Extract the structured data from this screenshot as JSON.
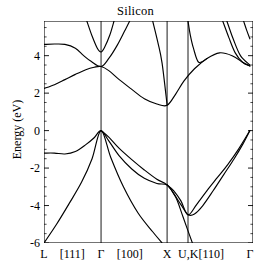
{
  "figure": {
    "title": "Silicon",
    "cropped_header_text": "",
    "background": "#ffffff",
    "line_color": "#000000"
  },
  "chart_data": {
    "type": "line",
    "title": "Silicon",
    "xlabel": "",
    "ylabel": "Energy (eV)",
    "ylim": [
      -6,
      5.85
    ],
    "xlim": [
      0,
      1
    ],
    "grid": false,
    "legend": null,
    "x_tick_labels": [
      "L",
      "[111]",
      "Γ",
      "[100]",
      "X",
      "U,K",
      "[110]",
      "Γ"
    ],
    "x_tick_positions": [
      0.0,
      0.135,
      0.273,
      0.41,
      0.589,
      0.69,
      0.8,
      0.985
    ],
    "y_ticks": [
      -6,
      -4,
      -2,
      0,
      2,
      4
    ],
    "y_tick_labels": [
      "-6",
      "-4",
      "-2",
      "0",
      "2",
      "4"
    ],
    "high_symmetry_lines": [
      {
        "label": "Γ",
        "x": 0.273
      },
      {
        "label": "X",
        "x": 0.589
      },
      {
        "label": "U,K",
        "x": 0.689
      }
    ],
    "annotations": {
      "valence_band_maximum_eV": 0.0,
      "conduction_band_minimum_eV": 1.37,
      "gap_type": "indirect",
      "vbm_point": "Γ",
      "cbm_point": "near X"
    },
    "series": [
      {
        "name": "valence-band-1",
        "points": [
          [
            0.0,
            -6.0
          ],
          [
            0.06,
            -5.0
          ],
          [
            0.12,
            -3.9
          ],
          [
            0.18,
            -2.75
          ],
          [
            0.23,
            -1.5
          ],
          [
            0.273,
            0.0
          ],
          [
            0.32,
            -1.45
          ],
          [
            0.38,
            -3.0
          ],
          [
            0.45,
            -4.4
          ],
          [
            0.52,
            -5.4
          ],
          [
            0.565,
            -6.0
          ]
        ]
      },
      {
        "name": "valence-band-2",
        "points": [
          [
            0.0,
            -1.2
          ],
          [
            0.05,
            -1.2
          ],
          [
            0.1,
            -1.25
          ],
          [
            0.15,
            -1.12
          ],
          [
            0.2,
            -0.75
          ],
          [
            0.24,
            -0.38
          ],
          [
            0.273,
            0.0
          ],
          [
            0.31,
            -0.55
          ],
          [
            0.36,
            -1.35
          ],
          [
            0.42,
            -2.05
          ],
          [
            0.48,
            -2.55
          ],
          [
            0.54,
            -2.82
          ],
          [
            0.589,
            -2.9
          ],
          [
            0.62,
            -3.35
          ],
          [
            0.655,
            -3.95
          ],
          [
            0.689,
            -4.48
          ],
          [
            0.72,
            -4.45
          ],
          [
            0.76,
            -4.0
          ],
          [
            0.81,
            -3.2
          ],
          [
            0.86,
            -2.35
          ],
          [
            0.91,
            -1.5
          ],
          [
            0.95,
            -0.75
          ],
          [
            0.985,
            0.0
          ]
        ]
      },
      {
        "name": "valence-band-3",
        "points": [
          [
            0.273,
            0.0
          ],
          [
            0.31,
            -0.35
          ],
          [
            0.36,
            -0.95
          ],
          [
            0.42,
            -1.55
          ],
          [
            0.48,
            -2.1
          ],
          [
            0.54,
            -2.6
          ],
          [
            0.589,
            -2.9
          ],
          [
            0.63,
            -3.55
          ],
          [
            0.665,
            -4.6
          ],
          [
            0.689,
            -5.35
          ],
          [
            0.71,
            -6.0
          ]
        ]
      },
      {
        "name": "valence-band-4",
        "points": [
          [
            0.589,
            -2.9
          ],
          [
            0.62,
            -3.2
          ],
          [
            0.655,
            -3.75
          ],
          [
            0.689,
            -4.5
          ],
          [
            0.73,
            -3.95
          ],
          [
            0.78,
            -3.2
          ],
          [
            0.83,
            -2.5
          ],
          [
            0.88,
            -1.8
          ],
          [
            0.93,
            -1.0
          ],
          [
            0.985,
            0.0
          ]
        ]
      },
      {
        "name": "conduction-band-1",
        "points": [
          [
            0.0,
            2.25
          ],
          [
            0.05,
            2.45
          ],
          [
            0.1,
            2.72
          ],
          [
            0.15,
            3.0
          ],
          [
            0.2,
            3.25
          ],
          [
            0.24,
            3.38
          ],
          [
            0.273,
            3.42
          ],
          [
            0.31,
            3.2
          ],
          [
            0.36,
            2.72
          ],
          [
            0.42,
            2.2
          ],
          [
            0.48,
            1.7
          ],
          [
            0.54,
            1.42
          ],
          [
            0.589,
            1.35
          ],
          [
            0.63,
            1.95
          ],
          [
            0.67,
            2.65
          ],
          [
            0.72,
            3.3
          ],
          [
            0.78,
            3.85
          ],
          [
            0.84,
            4.15
          ],
          [
            0.9,
            4.0
          ],
          [
            0.95,
            3.65
          ],
          [
            0.985,
            3.45
          ]
        ]
      },
      {
        "name": "conduction-band-2",
        "points": [
          [
            0.0,
            4.6
          ],
          [
            0.05,
            4.62
          ],
          [
            0.1,
            4.6
          ],
          [
            0.15,
            4.4
          ],
          [
            0.19,
            4.0
          ],
          [
            0.225,
            3.7
          ],
          [
            0.273,
            3.42
          ],
          [
            0.31,
            3.85
          ],
          [
            0.35,
            4.55
          ],
          [
            0.385,
            5.3
          ],
          [
            0.41,
            5.85
          ]
        ]
      },
      {
        "name": "conduction-band-3",
        "points": [
          [
            0.205,
            5.85
          ],
          [
            0.23,
            5.05
          ],
          [
            0.255,
            4.4
          ],
          [
            0.273,
            4.2
          ],
          [
            0.29,
            4.45
          ],
          [
            0.315,
            5.1
          ],
          [
            0.335,
            5.85
          ]
        ]
      },
      {
        "name": "conduction-band-4",
        "points": [
          [
            0.52,
            5.85
          ],
          [
            0.545,
            4.7
          ],
          [
            0.565,
            3.6
          ],
          [
            0.589,
            1.37
          ]
        ]
      },
      {
        "name": "conduction-band-5",
        "points": [
          [
            0.689,
            5.85
          ],
          [
            0.7,
            5.1
          ],
          [
            0.715,
            4.4
          ],
          [
            0.74,
            3.65
          ],
          [
            0.78,
            3.85
          ]
        ]
      },
      {
        "name": "conduction-band-6",
        "points": [
          [
            0.855,
            5.85
          ],
          [
            0.885,
            4.95
          ],
          [
            0.915,
            4.15
          ],
          [
            0.95,
            3.65
          ],
          [
            0.985,
            3.45
          ]
        ]
      },
      {
        "name": "conduction-band-7",
        "points": [
          [
            0.875,
            5.85
          ],
          [
            0.905,
            4.9
          ],
          [
            0.94,
            4.0
          ],
          [
            0.985,
            3.5
          ]
        ]
      },
      {
        "name": "conduction-band-8",
        "points": [
          [
            0.955,
            5.85
          ],
          [
            0.97,
            5.35
          ],
          [
            0.985,
            4.9
          ]
        ]
      }
    ]
  }
}
